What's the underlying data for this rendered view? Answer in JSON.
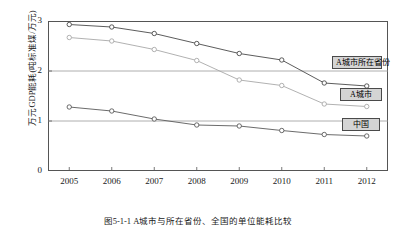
{
  "chart_data": {
    "type": "line",
    "title": "",
    "xlabel": "",
    "ylabel": "万元GDP能耗(吨标准煤/万元)",
    "categories": [
      "2005",
      "2006",
      "2007",
      "2008",
      "2009",
      "2010",
      "2011",
      "2012"
    ],
    "xlim": [
      2005,
      2012
    ],
    "ylim": [
      0,
      3
    ],
    "yticks": [
      "3",
      "2",
      "1",
      "0"
    ],
    "ytick_values": [
      3,
      2,
      1,
      0
    ],
    "grid": "horizontal",
    "legend_position": "inline-right",
    "series": [
      {
        "name": "A城市所在省份",
        "color": "#4a4a4a",
        "values": [
          2.93,
          2.88,
          2.75,
          2.55,
          2.35,
          2.22,
          1.76,
          1.7
        ]
      },
      {
        "name": "A城市",
        "color": "#a8a8a8",
        "values": [
          2.67,
          2.6,
          2.43,
          2.21,
          1.82,
          1.71,
          1.34,
          1.29
        ]
      },
      {
        "name": "中国",
        "color": "#5a5a5a",
        "values": [
          1.28,
          1.2,
          1.04,
          0.92,
          0.9,
          0.81,
          0.73,
          0.7
        ]
      }
    ],
    "annotations": [
      {
        "label": "A城市所在省份",
        "series": "A城市所在省份"
      },
      {
        "label": "A城市",
        "series": "A城市"
      },
      {
        "label": "中国",
        "series": "中国"
      }
    ]
  },
  "caption": "图5-1-1  A城市与所在省份、全国的单位能耗比较"
}
